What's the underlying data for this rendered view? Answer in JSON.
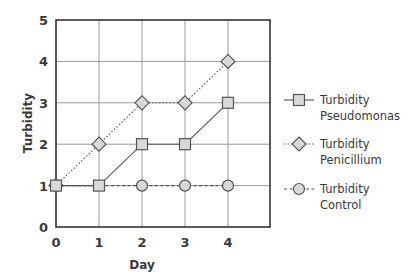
{
  "chart_data": {
    "type": "line",
    "title": "",
    "xlabel": "Day",
    "ylabel": "Turbidity",
    "x": [
      0,
      1,
      2,
      3,
      4
    ],
    "x_ticks": [
      "0",
      "1",
      "2",
      "3",
      "4"
    ],
    "y_ticks": [
      "0",
      "1",
      "2",
      "3",
      "4",
      "5"
    ],
    "xlim": [
      0,
      5
    ],
    "ylim": [
      0,
      5
    ],
    "grid": true,
    "legend_position": "right",
    "series": [
      {
        "name": "Turbidity Pseudomonas",
        "legend_lines": [
          "Turbidity",
          "Pseudomonas"
        ],
        "marker": "square",
        "line": "solid",
        "values": [
          1,
          1,
          2,
          2,
          3
        ]
      },
      {
        "name": "Turbidity Penicillium",
        "legend_lines": [
          "Turbidity",
          "Penicillium"
        ],
        "marker": "diamond",
        "line": "dotted",
        "values": [
          1,
          2,
          3,
          3,
          4
        ]
      },
      {
        "name": "Turbidity Control",
        "legend_lines": [
          "Turbidity",
          "Control"
        ],
        "marker": "circle",
        "line": "dashed",
        "values": [
          1,
          1,
          1,
          1,
          1
        ]
      }
    ],
    "colors": {
      "line": "#555555",
      "marker_fill": "#d9d9d9",
      "grid": "#999999",
      "axis": "#333333"
    }
  }
}
